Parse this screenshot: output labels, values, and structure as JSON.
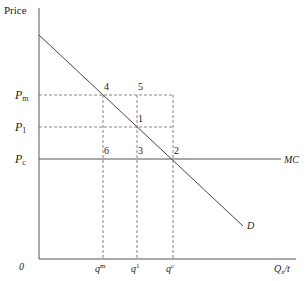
{
  "diagram": {
    "y_axis_label": "Price",
    "x_axis_label": "Q",
    "x_axis_label_sub": "x",
    "x_axis_label_suffix": "/t",
    "origin_label": "0",
    "price_labels": [
      {
        "main": "P",
        "sub": "m"
      },
      {
        "main": "P",
        "sub": "1"
      },
      {
        "main": "P",
        "sub": "c"
      }
    ],
    "quantity_labels": [
      {
        "main": "q",
        "sup": "m"
      },
      {
        "main": "q",
        "sup": "1"
      },
      {
        "main": "q",
        "sup": "c"
      }
    ],
    "points": [
      "4",
      "5",
      "1",
      "6",
      "3",
      "2"
    ],
    "curves": {
      "mc_label": "MC",
      "demand_label": "D"
    }
  }
}
